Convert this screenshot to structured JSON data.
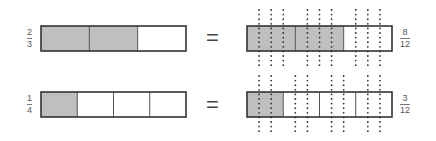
{
  "diagram": {
    "shade_color": "#bfbfbf",
    "border_color": "#333333",
    "dot_color": "#333333",
    "rows": [
      {
        "left": {
          "numerator": "2",
          "denominator": "3",
          "parts": 3,
          "shaded": 2
        },
        "equals": "=",
        "right": {
          "numerator": "8",
          "denominator": "12",
          "parts": 3,
          "shaded": 2,
          "subdivisions": 4
        }
      },
      {
        "left": {
          "numerator": "1",
          "denominator": "4",
          "parts": 4,
          "shaded": 1
        },
        "equals": "=",
        "right": {
          "numerator": "3",
          "denominator": "12",
          "parts": 4,
          "shaded": 1,
          "subdivisions": 3
        }
      }
    ]
  }
}
